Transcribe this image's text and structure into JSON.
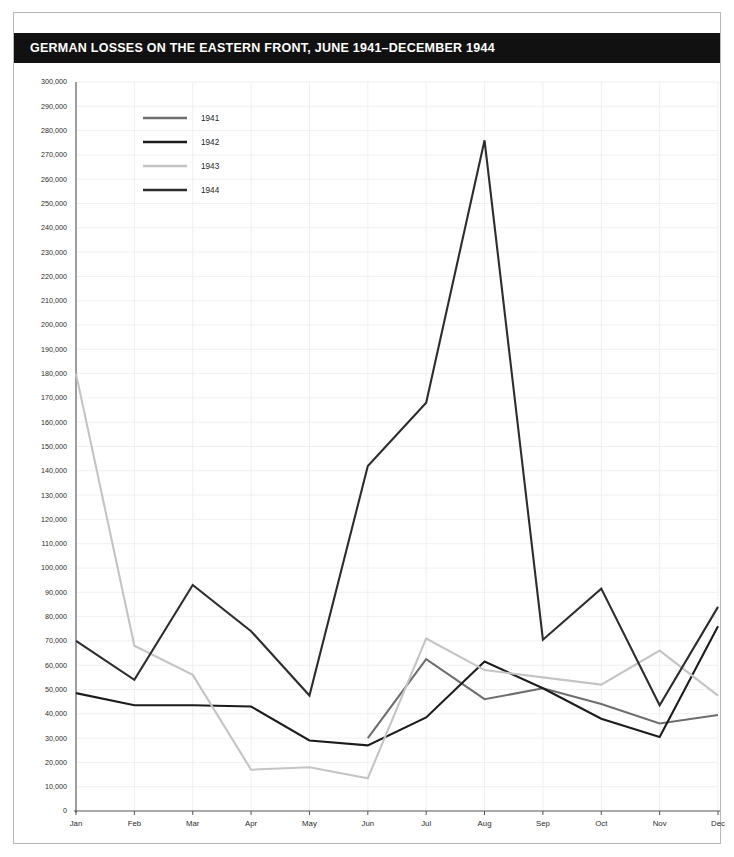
{
  "header": {
    "title": "GERMAN LOSSES ON THE EASTERN FRONT, JUNE 1941–DECEMBER 1944",
    "bar_color": "#111111",
    "text_color": "#ffffff"
  },
  "legend": {
    "position": "top-left-inside",
    "entries": [
      {
        "label": "1941",
        "color": "#6e6e6e"
      },
      {
        "label": "1942",
        "color": "#1c1c1c"
      },
      {
        "label": "1943",
        "color": "#c4c4c4"
      },
      {
        "label": "1944",
        "color": "#2d2d2d"
      }
    ]
  },
  "axes": {
    "y_tick_labels": [
      "300,000",
      "290,000",
      "280,000",
      "270,000",
      "260,000",
      "250,000",
      "240,000",
      "230,000",
      "220,000",
      "210,000",
      "200,000",
      "190,000",
      "180,000",
      "170,000",
      "160,000",
      "150,000",
      "140,000",
      "130,000",
      "120,000",
      "110,000",
      "100,000",
      "90,000",
      "80,000",
      "70,000",
      "60,000",
      "50,000",
      "40,000",
      "30,000",
      "20,000",
      "10,000",
      "0"
    ],
    "x_tick_labels": [
      "Jan",
      "Feb",
      "Mar",
      "Apr",
      "May",
      "Jun",
      "Jul",
      "Aug",
      "Sep",
      "Oct",
      "Nov",
      "Dec"
    ]
  },
  "chart_data": {
    "type": "line",
    "title": "GERMAN LOSSES ON THE EASTERN FRONT, JUNE 1941–DECEMBER 1944",
    "xlabel": "",
    "ylabel": "",
    "categories": [
      "Jan",
      "Feb",
      "Mar",
      "Apr",
      "May",
      "Jun",
      "Jul",
      "Aug",
      "Sep",
      "Oct",
      "Nov",
      "Dec"
    ],
    "ylim": [
      0,
      300000
    ],
    "ytick_step": 10000,
    "grid": true,
    "legend_position": "top-left-inside",
    "series": [
      {
        "name": "1941",
        "color": "#6e6e6e",
        "values": [
          null,
          null,
          null,
          null,
          null,
          30000,
          62500,
          46000,
          50500,
          44000,
          36000,
          39500
        ]
      },
      {
        "name": "1942",
        "color": "#1c1c1c",
        "values": [
          48500,
          43500,
          43500,
          43000,
          29000,
          27000,
          38500,
          61500,
          50500,
          38000,
          30500,
          76000
        ]
      },
      {
        "name": "1943",
        "color": "#c4c4c4",
        "values": [
          180000,
          68000,
          56000,
          17000,
          18000,
          13500,
          71000,
          58000,
          55000,
          52000,
          66000,
          47500
        ]
      },
      {
        "name": "1944",
        "color": "#2d2d2d",
        "values": [
          70000,
          54000,
          93000,
          74000,
          47500,
          142000,
          168000,
          276000,
          70500,
          91500,
          43500,
          84000
        ]
      }
    ]
  }
}
